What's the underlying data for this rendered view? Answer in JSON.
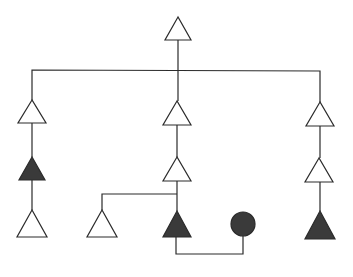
{
  "diagram": {
    "type": "pedigree",
    "width": 353,
    "height": 277,
    "colors": {
      "background": "#ffffff",
      "line": "#2b2b2b",
      "open_fill": "#ffffff",
      "filled_fill": "#3a3a3a"
    },
    "nodes": [
      {
        "id": "root",
        "shape": "triangle",
        "filled": false,
        "cx": 178,
        "top": 17,
        "bottom": 40,
        "half": 13
      },
      {
        "id": "left-1",
        "shape": "triangle",
        "filled": false,
        "cx": 32,
        "top": 100,
        "bottom": 123,
        "half": 14
      },
      {
        "id": "mid-1",
        "shape": "triangle",
        "filled": false,
        "cx": 177,
        "top": 101,
        "bottom": 125,
        "half": 14
      },
      {
        "id": "right-1",
        "shape": "triangle",
        "filled": false,
        "cx": 320,
        "top": 102,
        "bottom": 126,
        "half": 14
      },
      {
        "id": "left-2",
        "shape": "triangle",
        "filled": true,
        "cx": 32,
        "top": 157,
        "bottom": 180,
        "half": 13
      },
      {
        "id": "mid-2",
        "shape": "triangle",
        "filled": false,
        "cx": 177,
        "top": 157,
        "bottom": 181,
        "half": 14
      },
      {
        "id": "right-2",
        "shape": "triangle",
        "filled": false,
        "cx": 319,
        "top": 158,
        "bottom": 182,
        "half": 14
      },
      {
        "id": "left-3",
        "shape": "triangle",
        "filled": false,
        "cx": 32,
        "top": 210,
        "bottom": 237,
        "half": 15
      },
      {
        "id": "mid-3a",
        "shape": "triangle",
        "filled": false,
        "cx": 102,
        "top": 210,
        "bottom": 237,
        "half": 15
      },
      {
        "id": "mid-3b",
        "shape": "triangle",
        "filled": true,
        "cx": 177,
        "top": 211,
        "bottom": 237,
        "half": 14
      },
      {
        "id": "mate",
        "shape": "circle",
        "filled": true,
        "cx": 243,
        "cy": 224,
        "r": 12
      },
      {
        "id": "right-3",
        "shape": "triangle",
        "filled": true,
        "cx": 320,
        "top": 211,
        "bottom": 239,
        "half": 15
      }
    ],
    "edges": [
      {
        "id": "root-stem",
        "points": [
          [
            178,
            40
          ],
          [
            178,
            101
          ]
        ]
      },
      {
        "id": "sibship-bar",
        "points": [
          [
            32,
            100
          ],
          [
            32,
            70
          ],
          [
            320,
            71
          ],
          [
            320,
            102
          ]
        ]
      },
      {
        "id": "left-stem-1",
        "points": [
          [
            32,
            123
          ],
          [
            32,
            157
          ]
        ]
      },
      {
        "id": "left-stem-2",
        "points": [
          [
            32,
            180
          ],
          [
            32,
            210
          ]
        ]
      },
      {
        "id": "mid-stem-1",
        "points": [
          [
            177,
            125
          ],
          [
            177,
            157
          ]
        ]
      },
      {
        "id": "mid-stem-2",
        "points": [
          [
            177,
            181
          ],
          [
            177,
            211
          ]
        ]
      },
      {
        "id": "mid-branch",
        "points": [
          [
            177,
            194
          ],
          [
            102,
            194
          ],
          [
            102,
            210
          ]
        ]
      },
      {
        "id": "marriage-line",
        "points": [
          [
            176,
            237
          ],
          [
            176,
            254
          ],
          [
            243,
            254
          ],
          [
            243,
            236
          ]
        ]
      },
      {
        "id": "right-stem-1",
        "points": [
          [
            320,
            126
          ],
          [
            320,
            158
          ]
        ]
      },
      {
        "id": "right-stem-2",
        "points": [
          [
            320,
            182
          ],
          [
            320,
            211
          ]
        ]
      }
    ]
  }
}
